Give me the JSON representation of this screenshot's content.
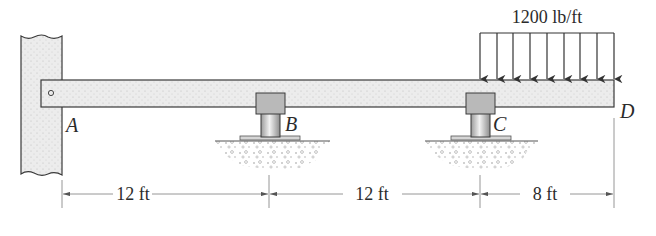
{
  "load": {
    "label": "1200 lb/ft",
    "magnitude": 1200,
    "unit": "lb/ft",
    "arrow_count": 9
  },
  "points": {
    "A": "A",
    "B": "B",
    "C": "C",
    "D": "D"
  },
  "dimensions": [
    {
      "label": "12 ft",
      "from": "A",
      "to": "B"
    },
    {
      "label": "12 ft",
      "from": "B",
      "to": "C"
    },
    {
      "label": "8 ft",
      "from": "C",
      "to": "D"
    }
  ],
  "colors": {
    "outline": "#3a3a3a",
    "beam_fill": "#e9e9e9",
    "wall_fill": "#e4e4e4",
    "support_block": "#b8b8b8",
    "post_fill": "#d0d0d0",
    "dimension_line": "#8a8a8a"
  }
}
